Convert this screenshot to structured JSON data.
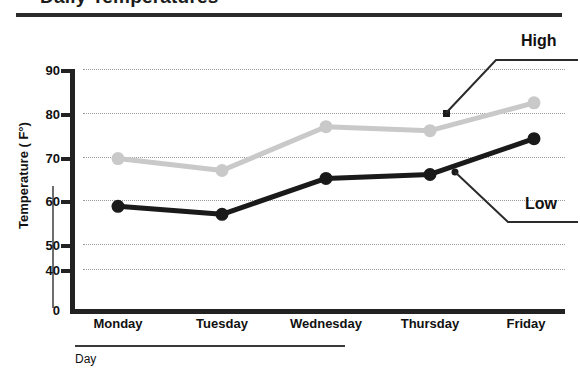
{
  "title": "Daily Temperatures",
  "chart_data": {
    "type": "line",
    "title": "Daily Temperatures",
    "xlabel": "Day",
    "ylabel": "Temperature ( F°)",
    "categories": [
      "Monday",
      "Tuesday",
      "Wednesday",
      "Thursday",
      "Friday"
    ],
    "series": [
      {
        "name": "High",
        "color": "#c9c9c9",
        "values": [
          68,
          65,
          76,
          75,
          82
        ]
      },
      {
        "name": "Low",
        "color": "#1a1a1a",
        "values": [
          56,
          54,
          63,
          64,
          73
        ]
      }
    ],
    "ylim": [
      0,
      90
    ],
    "yticks": [
      0,
      40,
      50,
      60,
      70,
      80,
      90
    ],
    "ytick_labels": [
      "0",
      "40",
      "50",
      "60",
      "70",
      "80",
      "90"
    ],
    "y_axis_break": true,
    "grid": "horizontal-dotted",
    "legend": "callout-labels",
    "annotations": [
      {
        "text": "High",
        "target_series": "High"
      },
      {
        "text": "Low",
        "target_series": "Low"
      }
    ]
  },
  "axis": {
    "y_ticks": [
      {
        "label": "90",
        "value": 90
      },
      {
        "label": "80",
        "value": 80
      },
      {
        "label": "70",
        "value": 70
      },
      {
        "label": "60",
        "value": 60
      },
      {
        "label": "50",
        "value": 50
      },
      {
        "label": "40",
        "value": 40
      },
      {
        "label": "0",
        "value": 0
      }
    ],
    "x_labels": [
      "Monday",
      "Tuesday",
      "Wednesday",
      "Thursday",
      "Friday"
    ],
    "x_title": "Day",
    "y_title": "Temperature ( F°)"
  },
  "callouts": {
    "high": "High",
    "low": "Low"
  },
  "colors": {
    "high_series": "#c9c9c9",
    "low_series": "#1a1a1a",
    "axis": "#222222",
    "gridline": "#9a9a9a",
    "background": "#ffffff"
  }
}
